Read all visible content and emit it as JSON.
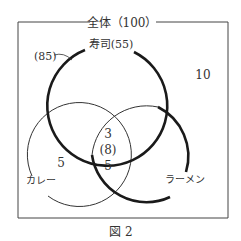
{
  "universe": {
    "label": "全体（100）",
    "outside_count": "10"
  },
  "sets": [
    {
      "id": "sushi",
      "label": "寿司(55)",
      "union_annotation": "(85)"
    },
    {
      "id": "curry",
      "label": "カレー"
    },
    {
      "id": "ramen",
      "label": "ラーメン"
    }
  ],
  "regions": {
    "curry_only": "5",
    "all_three": "3",
    "curry_ramen_total": "(8)",
    "curry_ramen_not_sushi": "5"
  },
  "caption": "図 2",
  "colors": {
    "line": "#333333",
    "thick_line": "#1a1a1a",
    "background": "#ffffff"
  }
}
